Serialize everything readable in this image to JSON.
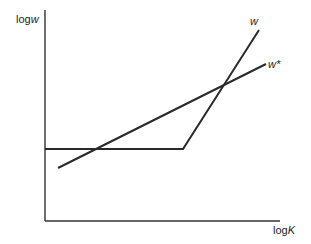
{
  "diagram": {
    "y_axis_label": {
      "prefix": "log",
      "var": "w"
    },
    "x_axis_label": {
      "prefix": "log",
      "var": "K"
    },
    "curves": [
      {
        "name": "w",
        "label": "w",
        "description": "flat then kinked upward steep line"
      },
      {
        "name": "w*",
        "label": "w*",
        "description": "straight upward sloping line"
      }
    ],
    "line_color": "#2a2a2a"
  }
}
